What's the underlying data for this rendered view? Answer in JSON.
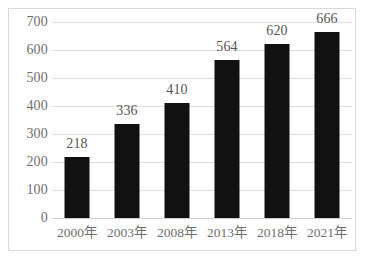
{
  "chart_data": {
    "type": "bar",
    "title": "",
    "subtitle": "",
    "xlabel": "",
    "ylabel": "",
    "categories": [
      "2000年",
      "2003年",
      "2008年",
      "2013年",
      "2018年",
      "2021年"
    ],
    "values": [
      218,
      336,
      410,
      564,
      620,
      666
    ],
    "data_labels": [
      "218",
      "336",
      "410",
      "564",
      "620",
      "666"
    ],
    "ylim": [
      0,
      700
    ],
    "y_ticks": [
      700,
      600,
      500,
      400,
      300,
      200,
      100,
      0
    ],
    "y_tick_labels": [
      "700",
      "600",
      "500",
      "400",
      "300",
      "200",
      "100",
      "0"
    ],
    "grid": true,
    "legend": false,
    "legend_position": "none",
    "bar_color": "#111111",
    "gridline_color": "#dedede",
    "text_color": "#6f6f6f",
    "background_color": "#ffffff",
    "border_color": "#d9d9d9"
  },
  "caption": {
    "text": ""
  }
}
